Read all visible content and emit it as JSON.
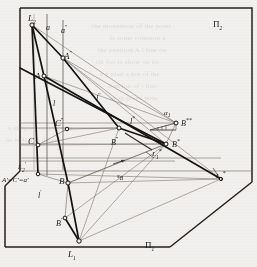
{
  "figure": {
    "plane_labels": {
      "pi1": "Π",
      "pi1_sub": "1",
      "pi2": "Π",
      "pi2_sub": "2"
    },
    "background_color": "#f2f0ee",
    "ink_color": "#1a1a1a",
    "thin_color": "#55504b",
    "labels": [
      {
        "id": "L2",
        "text": "L",
        "sub": "2",
        "sup": "",
        "x": 28,
        "y": 14,
        "size": "s9"
      },
      {
        "id": "a",
        "text": "a",
        "sub": "",
        "sup": "",
        "x": 46,
        "y": 24,
        "size": "s8"
      },
      {
        "id": "a2",
        "text": "a",
        "sub": "",
        "sup": "″",
        "x": 61,
        "y": 24,
        "size": "s8"
      },
      {
        "id": "A2",
        "text": "A",
        "sub": "",
        "sup": "″",
        "x": 64,
        "y": 50,
        "size": "s9"
      },
      {
        "id": "A",
        "text": "A",
        "sub": "",
        "sup": "",
        "x": 37,
        "y": 73,
        "size": "s9"
      },
      {
        "id": "l",
        "text": "l",
        "sub": "",
        "sup": "",
        "x": 53,
        "y": 100,
        "size": "s8"
      },
      {
        "id": "l2",
        "text": "l",
        "sub": "",
        "sup": "″",
        "x": 96,
        "y": 92,
        "size": "s8"
      },
      {
        "id": "C2",
        "text": "C",
        "sub": "",
        "sup": "″",
        "x": 57,
        "y": 118,
        "size": "s9"
      },
      {
        "id": "lstar",
        "text": "l",
        "sub": "",
        "sup": "*",
        "x": 130,
        "y": 116,
        "size": "s8"
      },
      {
        "id": "alpha1",
        "text": "α",
        "sub": "1",
        "sup": "",
        "x": 164,
        "y": 110,
        "size": "s7"
      },
      {
        "id": "Bss",
        "text": "B",
        "sub": "",
        "sup": "**",
        "x": 182,
        "y": 117,
        "size": "s8"
      },
      {
        "id": "C",
        "text": "C",
        "sub": "",
        "sup": "",
        "x": 30,
        "y": 138,
        "size": "s9"
      },
      {
        "id": "B2",
        "text": "B",
        "sub": "",
        "sup": "″",
        "x": 112,
        "y": 137,
        "size": "s8"
      },
      {
        "id": "Bs",
        "text": "B",
        "sub": "",
        "sup": "*",
        "x": 172,
        "y": 139,
        "size": "s8"
      },
      {
        "id": "L2p",
        "text": "L",
        "sub": "2",
        "sup": "′",
        "x": 18,
        "y": 163,
        "size": "s7"
      },
      {
        "id": "L1s_mid",
        "text": "L",
        "sub": "1",
        "sup": "*",
        "x": 151,
        "y": 152,
        "size": "s7"
      },
      {
        "id": "AeqCeqa",
        "text": "A′=C′=a′",
        "sub": "",
        "sup": "",
        "x": 2,
        "y": 178,
        "size": "s7"
      },
      {
        "id": "B",
        "text": "B",
        "sub": "",
        "sup": "",
        "x": 60,
        "y": 178,
        "size": "s9"
      },
      {
        "id": "sB",
        "text": "s",
        "sub": "B",
        "sup": "",
        "x": 117,
        "y": 175,
        "size": "s7"
      },
      {
        "id": "L1s_right",
        "text": "L",
        "sub": "1",
        "sup": "*",
        "x": 218,
        "y": 172,
        "size": "s7"
      },
      {
        "id": "lp",
        "text": "l",
        "sub": "",
        "sup": "′",
        "x": 38,
        "y": 190,
        "size": "s8"
      },
      {
        "id": "Bp",
        "text": "B",
        "sub": "",
        "sup": "′",
        "x": 58,
        "y": 219,
        "size": "s8"
      },
      {
        "id": "L1",
        "text": "L",
        "sub": "1",
        "sup": "",
        "x": 69,
        "y": 252,
        "size": "s9"
      },
      {
        "id": "Pi1",
        "text": "Π",
        "sub": "1",
        "sup": "",
        "x": 145,
        "y": 243,
        "size": "s9",
        "upright": true
      },
      {
        "id": "Pi2",
        "text": "Π",
        "sub": "2",
        "sup": "",
        "x": 215,
        "y": 22,
        "size": "s9",
        "upright": true
      }
    ],
    "points": [
      {
        "id": "L2",
        "x": 32,
        "y": 25
      },
      {
        "id": "A2",
        "x": 63,
        "y": 58
      },
      {
        "id": "A",
        "x": 44,
        "y": 76
      },
      {
        "id": "C2",
        "x": 67,
        "y": 129
      },
      {
        "id": "C",
        "x": 38,
        "y": 145
      },
      {
        "id": "B2",
        "x": 119,
        "y": 128
      },
      {
        "id": "B",
        "x": 68,
        "y": 183
      },
      {
        "id": "Bp",
        "x": 65,
        "y": 218
      },
      {
        "id": "Bs",
        "x": 166,
        "y": 144
      },
      {
        "id": "Bss",
        "x": 176,
        "y": 123
      },
      {
        "id": "L1",
        "x": 79,
        "y": 241
      },
      {
        "id": "L2p",
        "x": 38,
        "y": 174
      },
      {
        "id": "L1s",
        "x": 221,
        "y": 179
      }
    ],
    "ghost_text": [
      {
        "text": "the movement of the point",
        "x": 92,
        "y": 22
      },
      {
        "text": "is some common a",
        "x": 110,
        "y": 34
      },
      {
        "text": "the position A  I line on",
        "x": 98,
        "y": 46
      },
      {
        "text": "thi  foo  is  show  on  its",
        "x": 96,
        "y": 58
      },
      {
        "text": "a y  plan  a  ion  of  the",
        "x": 100,
        "y": 70
      },
      {
        "text": "it  m  ion  of  t  line",
        "x": 108,
        "y": 82
      },
      {
        "text": "of  th  given  poin",
        "x": 110,
        "y": 94
      },
      {
        "text": "a  simple  construction",
        "x": 8,
        "y": 124
      },
      {
        "text": "as  well  a  to  determ",
        "x": 6,
        "y": 136
      }
    ]
  }
}
